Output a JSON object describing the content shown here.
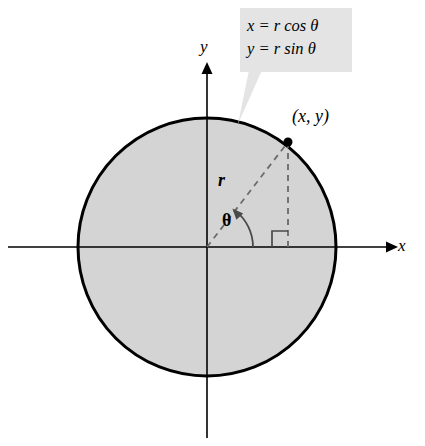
{
  "figure": {
    "background_color": "#ffffff"
  },
  "callout": {
    "name": "equation-callout",
    "background_color": "#e4e4e4",
    "equations": [
      "x = r cos θ",
      "y = r sin θ"
    ],
    "line1": {
      "lhs": "x",
      "equals": " = ",
      "radius": "r",
      "function": "cos",
      "angle": "θ"
    },
    "line2": {
      "lhs": "y",
      "equals": " = ",
      "radius": "r",
      "function": "sin",
      "angle": "θ"
    }
  },
  "axes": {
    "x_label": "x",
    "y_label": "y",
    "color": "#000000",
    "origin": {
      "x": 207,
      "y": 247
    }
  },
  "circle": {
    "name": "shaded-circle",
    "center": {
      "x": 207,
      "y": 247
    },
    "radius": 129,
    "fill_color": "#d4d4d4",
    "stroke_color": "#000000",
    "stroke_width": 3
  },
  "point": {
    "label": "(x, y)",
    "coordinates": {
      "x": 288,
      "y": 142
    },
    "marker_color": "#000000",
    "marker_radius": 4.5
  },
  "radius_segment": {
    "label": "r",
    "style": "dashed",
    "color": "#6a6a6a",
    "from": {
      "x": 207,
      "y": 247
    },
    "to": {
      "x": 288,
      "y": 142
    }
  },
  "vertical_segment": {
    "style": "dashed",
    "color": "#6a6a6a",
    "from": {
      "x": 288,
      "y": 142
    },
    "to": {
      "x": 288,
      "y": 247
    }
  },
  "angle": {
    "label": "θ",
    "degrees": 52,
    "arc_color": "#4a4a4a",
    "arc_radius": 46,
    "has_arrowhead": true
  },
  "right_angle_marker": {
    "name": "right-angle-marker",
    "size": 16,
    "color": "#4a4a4a",
    "at": {
      "x": 288,
      "y": 247
    }
  }
}
